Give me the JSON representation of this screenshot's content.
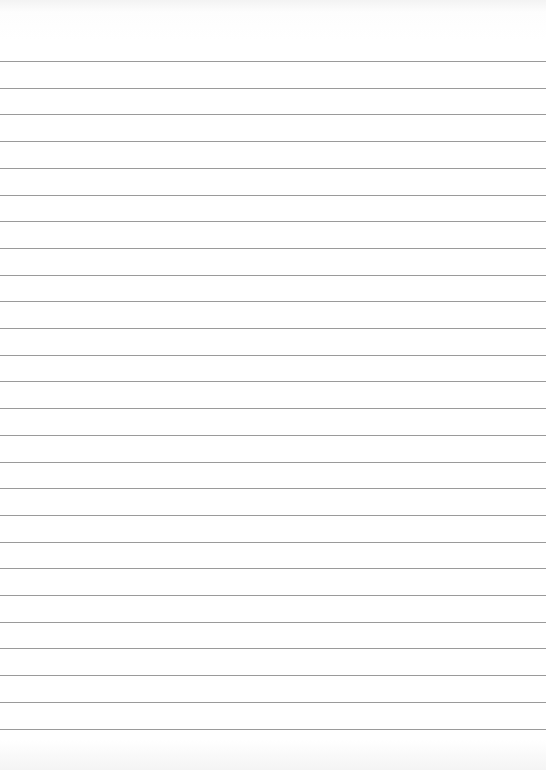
{
  "page": {
    "type": "lined-paper",
    "background_color": "#ffffff",
    "line_color": "#9a9a9a",
    "line_count": 26,
    "first_line_y": 61,
    "line_spacing": 26.7
  }
}
